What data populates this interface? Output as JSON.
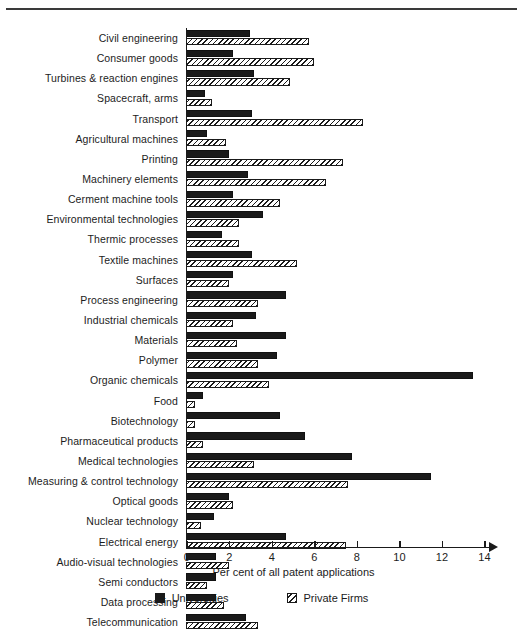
{
  "chart_data": {
    "type": "bar",
    "orientation": "horizontal",
    "title": "",
    "xlabel": "Per cent of all patent applications",
    "ylabel": "",
    "xlim": [
      0,
      14
    ],
    "xticks": [
      0,
      2,
      4,
      6,
      8,
      10,
      12,
      14
    ],
    "grid": false,
    "legend_position": "bottom",
    "categories": [
      "Civil engineering",
      "Consumer goods",
      "Turbines & reaction engines",
      "Spacecraft, arms",
      "Transport",
      "Agricultural machines",
      "Printing",
      "Machinery elements",
      "Cerment machine tools",
      "Environmental technologies",
      "Thermic processes",
      "Textile machines",
      "Surfaces",
      "Process engineering",
      "Industrial chemicals",
      "Materials",
      "Polymer",
      "Organic chemicals",
      "Food",
      "Biotechnology",
      "Pharmaceutical products",
      "Medical technologies",
      "Measuring & control technology",
      "Optical goods",
      "Nuclear technology",
      "Electrical energy",
      "Audio-visual technologies",
      "Semi conductors",
      "Data processing",
      "Telecommunication"
    ],
    "series": [
      {
        "name": "Universities",
        "color": "#1a1a1a",
        "values": [
          3.0,
          2.2,
          3.2,
          0.9,
          3.1,
          1.0,
          2.0,
          2.9,
          2.2,
          3.6,
          1.7,
          3.1,
          2.2,
          4.7,
          3.3,
          4.7,
          4.3,
          13.5,
          0.8,
          4.4,
          5.6,
          7.8,
          11.5,
          2.0,
          1.3,
          4.7,
          1.4,
          1.4,
          1.4,
          2.8
        ]
      },
      {
        "name": "Private Firms",
        "color": "#ffffff",
        "hatch": "diagonal",
        "values": [
          5.8,
          6.0,
          4.9,
          1.2,
          8.3,
          1.9,
          7.4,
          6.6,
          4.4,
          2.5,
          2.5,
          5.2,
          2.0,
          3.4,
          2.2,
          2.4,
          3.4,
          3.9,
          0.4,
          0.4,
          0.8,
          3.2,
          7.6,
          2.2,
          0.7,
          7.5,
          2.0,
          1.0,
          1.8,
          3.4
        ]
      }
    ]
  },
  "legend": {
    "items": [
      {
        "label": "Universities"
      },
      {
        "label": "Private Firms"
      }
    ]
  }
}
